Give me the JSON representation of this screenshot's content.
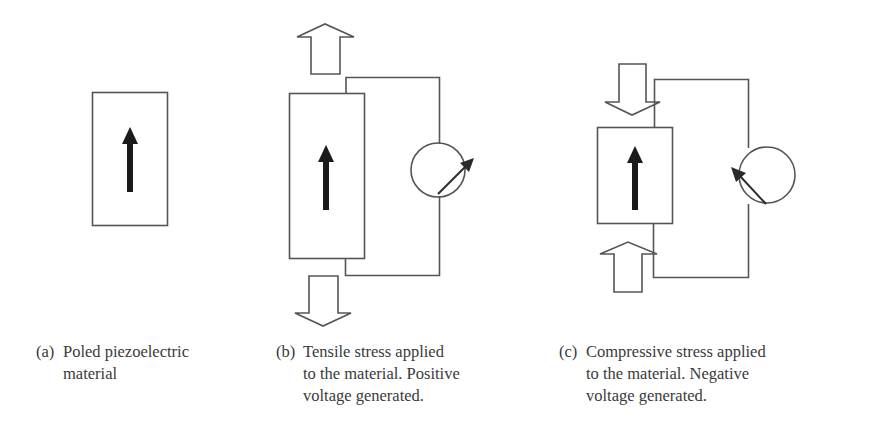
{
  "figure": {
    "panels": [
      {
        "id": "a",
        "label": "(a)",
        "caption_lines": [
          "Poled piezoelectric",
          "material"
        ],
        "stress": "none",
        "polarization_direction": "up",
        "meter": null
      },
      {
        "id": "b",
        "label": "(b)",
        "caption_lines": [
          "Tensile stress applied",
          "to the material. Positive",
          "voltage generated."
        ],
        "stress": "tensile",
        "stress_arrows": [
          "up-arrow-above",
          "down-arrow-below"
        ],
        "polarization_direction": "up",
        "meter": {
          "needle_direction": "up-right",
          "voltage_sign": "positive"
        }
      },
      {
        "id": "c",
        "label": "(c)",
        "caption_lines": [
          "Compressive stress applied",
          "to the material. Negative",
          "voltage generated."
        ],
        "stress": "compressive",
        "stress_arrows": [
          "down-arrow-above",
          "up-arrow-below"
        ],
        "polarization_direction": "up",
        "meter": {
          "needle_direction": "up-left",
          "voltage_sign": "negative"
        }
      }
    ],
    "colors": {
      "line": "#555555",
      "pole_arrow": "#1a1a1a",
      "text": "#3a3a3a",
      "background": "#ffffff"
    }
  }
}
